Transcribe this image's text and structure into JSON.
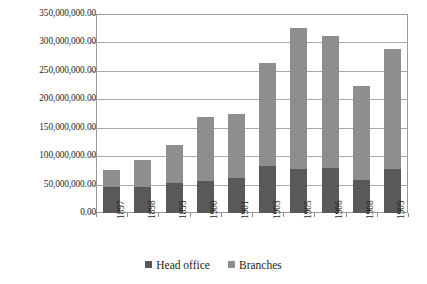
{
  "chart_data": {
    "type": "bar",
    "stacked": true,
    "title": "",
    "xlabel": "",
    "ylabel": "",
    "ylim": [
      0,
      350000000
    ],
    "ytick_step": 50000000,
    "grid": true,
    "legend_position": "bottom",
    "categories": [
      "1897",
      "1898",
      "1899",
      "1900",
      "1901",
      "1903",
      "1905",
      "1906",
      "1908",
      "1909"
    ],
    "ytick_labels": [
      "350,000,000.00",
      "300,000,000.00",
      "250,000,000.00",
      "200,000,000.00",
      "150,000,000.00",
      "100,000,000.00",
      "50,000,000.00",
      "0.00"
    ],
    "ytick_values": [
      350000000,
      300000000,
      250000000,
      200000000,
      150000000,
      100000000,
      50000000,
      0
    ],
    "series": [
      {
        "name": "Head office",
        "color": "#595959",
        "values": [
          45000000,
          45000000,
          52000000,
          57000000,
          61000000,
          82000000,
          78000000,
          79000000,
          58000000,
          78000000
        ]
      },
      {
        "name": "Branches",
        "color": "#8e8e8e",
        "values": [
          31000000,
          48000000,
          67000000,
          111000000,
          113000000,
          181000000,
          247000000,
          232000000,
          165000000,
          210000000
        ]
      }
    ],
    "totals": [
      76000000,
      93000000,
      119000000,
      168000000,
      174000000,
      263000000,
      325000000,
      311000000,
      223000000,
      288000000
    ],
    "legend": [
      "Head office",
      "Branches"
    ],
    "colors": {
      "head_office": "#595959",
      "branches": "#8e8e8e",
      "gridline": "#a8a8a8",
      "axis": "#8d8d8d",
      "text": "#231f20",
      "background": "#ffffff"
    }
  }
}
